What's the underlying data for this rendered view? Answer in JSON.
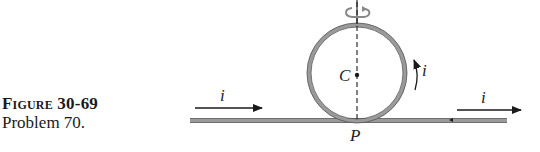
{
  "caption": {
    "figure_label": "Figure 30-69",
    "problem": "Problem 70."
  },
  "diagram": {
    "labels": {
      "center": "C",
      "point": "P",
      "current_left": "i",
      "current_loop": "i",
      "current_right": "i"
    },
    "icons": [
      "rotation-arrow-icon",
      "current-arrow-icon"
    ],
    "colors": {
      "wire": "#8a8a8a",
      "ink": "#1a1a1a"
    }
  }
}
